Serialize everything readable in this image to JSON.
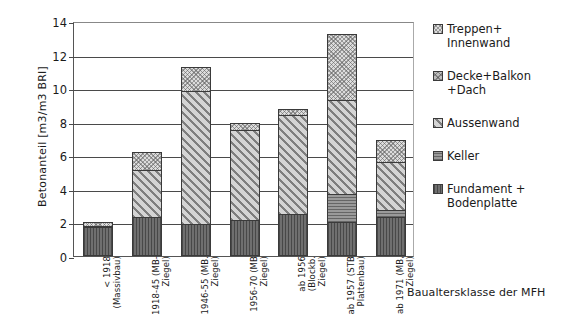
{
  "chart_data": {
    "type": "bar",
    "subtype": "stacked-vertical",
    "title": "",
    "xlabel": "Baualtersklasse der MFH",
    "ylabel": "Betonanteil  [m3/m3 BRI]",
    "ylim": [
      0,
      14
    ],
    "yticks": [
      0,
      2,
      4,
      6,
      8,
      10,
      12,
      14
    ],
    "grid": "horizontal",
    "legend_position": "right",
    "categories": [
      "< 1918\n(Massivbau)",
      "1918-45 (MB-\nZiegel)",
      "1946-55 (MB.\nZiegel)",
      "1956-70 (MB\nZiegel)",
      "ab 1956 (Blockb.\nZiegel)",
      "ab 1957 (STB\nPlattenbau)",
      "ab 1971 (MB,\nZiegel)"
    ],
    "series": [
      {
        "name": "Fundament + Bodenplatte",
        "pattern": "pat-fundament",
        "color": "#6f6f6f",
        "values": [
          1.75,
          2.35,
          1.9,
          2.15,
          2.5,
          2.0,
          2.3
        ]
      },
      {
        "name": "Keller",
        "pattern": "pat-keller",
        "color": "#9a9a9a",
        "values": [
          0.0,
          0.0,
          0.0,
          0.0,
          0.0,
          1.7,
          0.45
        ]
      },
      {
        "name": "Aussenwand",
        "pattern": "pat-aussenwand",
        "color": "#d4d4d4",
        "values": [
          0.05,
          2.75,
          7.95,
          5.35,
          5.9,
          5.6,
          2.85
        ]
      },
      {
        "name": "Decke+Balkon+Dach",
        "pattern": "pat-decke",
        "color": "#bdbdbd",
        "values": [
          0.0,
          0.0,
          0.0,
          0.0,
          0.0,
          0.0,
          0.0
        ]
      },
      {
        "name": "Treppen+Innenwand",
        "pattern": "pat-treppen",
        "color": "#dcdcdc",
        "values": [
          0.2,
          1.1,
          1.4,
          0.4,
          0.35,
          3.9,
          1.3
        ]
      }
    ],
    "totals": [
      2.0,
      6.2,
      11.25,
      7.9,
      8.75,
      13.2,
      6.9
    ]
  },
  "legend": {
    "items": [
      {
        "label": "Treppen+\nInnenwand",
        "swatch": "pat-treppen"
      },
      {
        "label": "Decke+Balkon\n+Dach",
        "swatch": "pat-decke"
      },
      {
        "label": "Aussenwand",
        "swatch": "pat-aussenwand"
      },
      {
        "label": "Keller",
        "swatch": "pat-keller"
      },
      {
        "label": "Fundament +\nBodenplatte",
        "swatch": "pat-fundament"
      }
    ]
  }
}
